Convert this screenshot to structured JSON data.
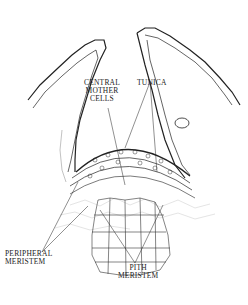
{
  "diagram": {
    "type": "botanical cross-section of shoot apical meristem",
    "labels": {
      "central_mother_cells_line1": "CENTRAL",
      "central_mother_cells_line2": "MOTHER",
      "central_mother_cells_line3": "CELLS",
      "tunica": "TUNICA",
      "peripheral_meristem_line1": "PERIPHERAL",
      "peripheral_meristem_line2": "MERISTEM",
      "pith_meristem_line1": "PITH",
      "pith_meristem_line2": "MERISTEM"
    },
    "colors": {
      "ink": "#222222",
      "light_ink": "#9a9a9a",
      "background": "#ffffff"
    }
  }
}
